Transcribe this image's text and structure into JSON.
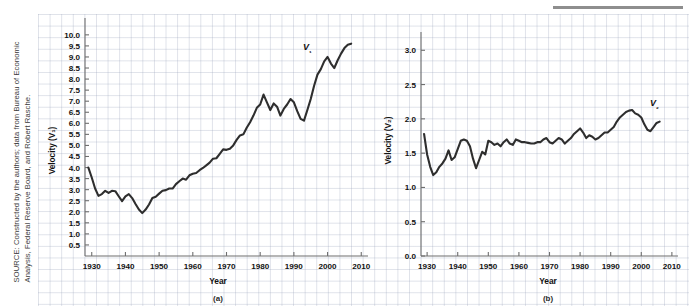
{
  "figure": {
    "source_note": "SOURCE: Constructed by the authors; data from Bureau of Economic Analysis, Federal Reserve Board, and Robert Rasche.",
    "panel_a_caption": "(a)",
    "panel_b_caption": "(b)"
  },
  "chart_data": [
    {
      "type": "line",
      "id": "panel-a",
      "title": "",
      "xlabel": "Year",
      "ylabel": "Velocity (V₁)",
      "series_label": "V₁",
      "xlim": [
        1928,
        2012
      ],
      "ylim": [
        0.0,
        10.4
      ],
      "xticks": [
        1930,
        1940,
        1950,
        1960,
        1970,
        1980,
        1990,
        2000,
        2010
      ],
      "xticklabels": [
        "1930",
        "1940",
        "1950",
        "1960",
        "1970",
        "1980",
        "1990",
        "2000",
        "2010"
      ],
      "yticks": [
        0.5,
        1.0,
        1.5,
        2.0,
        2.5,
        3.0,
        3.5,
        4.0,
        4.5,
        5.0,
        5.5,
        6.0,
        6.5,
        7.0,
        7.5,
        8.0,
        8.5,
        9.0,
        9.5,
        10.0
      ],
      "yticklabels": [
        "0.5",
        "1.0",
        "1.5",
        "2.0",
        "2.5",
        "3.0",
        "3.5",
        "4.0",
        "4.5",
        "5.0",
        "5.5",
        "6.0",
        "6.5",
        "7.0",
        "7.5",
        "8.0",
        "8.5",
        "9.0",
        "9.5",
        "10.0"
      ],
      "grid": true,
      "legend": "inline-label",
      "x": [
        1929,
        1930,
        1931,
        1932,
        1933,
        1934,
        1935,
        1936,
        1937,
        1938,
        1939,
        1940,
        1941,
        1942,
        1943,
        1944,
        1945,
        1946,
        1947,
        1948,
        1949,
        1950,
        1951,
        1952,
        1953,
        1954,
        1955,
        1956,
        1957,
        1958,
        1959,
        1960,
        1961,
        1962,
        1963,
        1964,
        1965,
        1966,
        1967,
        1968,
        1969,
        1970,
        1971,
        1972,
        1973,
        1974,
        1975,
        1976,
        1977,
        1978,
        1979,
        1980,
        1981,
        1982,
        1983,
        1984,
        1985,
        1986,
        1987,
        1988,
        1989,
        1990,
        1991,
        1992,
        1993,
        1994,
        1995,
        1996,
        1997,
        1998,
        1999,
        2000,
        2001,
        2002,
        2003,
        2004,
        2005,
        2006,
        2007
      ],
      "y": [
        4.0,
        3.55,
        3.05,
        2.72,
        2.8,
        2.95,
        2.85,
        2.95,
        2.93,
        2.7,
        2.48,
        2.7,
        2.8,
        2.62,
        2.35,
        2.1,
        1.94,
        2.1,
        2.33,
        2.62,
        2.68,
        2.82,
        2.95,
        2.98,
        3.05,
        3.05,
        3.25,
        3.38,
        3.5,
        3.45,
        3.65,
        3.72,
        3.75,
        3.88,
        3.98,
        4.1,
        4.22,
        4.4,
        4.42,
        4.62,
        4.82,
        4.8,
        4.85,
        5.0,
        5.25,
        5.45,
        5.5,
        5.8,
        6.05,
        6.35,
        6.7,
        6.85,
        7.3,
        6.95,
        6.6,
        6.9,
        6.75,
        6.35,
        6.65,
        6.85,
        7.1,
        6.95,
        6.55,
        6.2,
        6.12,
        6.6,
        7.1,
        7.7,
        8.2,
        8.45,
        8.8,
        9.0,
        8.7,
        8.5,
        8.85,
        9.15,
        9.4,
        9.55,
        9.6
      ]
    },
    {
      "type": "line",
      "id": "panel-b",
      "title": "",
      "xlabel": "Year",
      "ylabel": "Velocity (V₂)",
      "series_label": "V₂",
      "xlim": [
        1928,
        2012
      ],
      "ylim": [
        0.0,
        3.15
      ],
      "xticks": [
        1930,
        1940,
        1950,
        1960,
        1970,
        1980,
        1990,
        2000,
        2010
      ],
      "xticklabels": [
        "1930",
        "1940",
        "1950",
        "1960",
        "1970",
        "1980",
        "1990",
        "2000",
        "2010"
      ],
      "yticks": [
        0.0,
        0.5,
        1.0,
        1.5,
        2.0,
        2.5,
        3.0
      ],
      "yticklabels": [
        "0.0",
        "0.5",
        "1.0",
        "1.5",
        "2.0",
        "2.5",
        "3.0"
      ],
      "grid": true,
      "legend": "inline-label",
      "x": [
        1929,
        1930,
        1931,
        1932,
        1933,
        1934,
        1935,
        1936,
        1937,
        1938,
        1939,
        1940,
        1941,
        1942,
        1943,
        1944,
        1945,
        1946,
        1947,
        1948,
        1949,
        1950,
        1951,
        1952,
        1953,
        1954,
        1955,
        1956,
        1957,
        1958,
        1959,
        1960,
        1961,
        1962,
        1963,
        1964,
        1965,
        1966,
        1967,
        1968,
        1969,
        1970,
        1971,
        1972,
        1973,
        1974,
        1975,
        1976,
        1977,
        1978,
        1979,
        1980,
        1981,
        1982,
        1983,
        1984,
        1985,
        1986,
        1987,
        1988,
        1989,
        1990,
        1991,
        1992,
        1993,
        1994,
        1995,
        1996,
        1997,
        1998,
        1999,
        2000,
        2001,
        2002,
        2003,
        2004,
        2005,
        2006
      ],
      "y": [
        1.78,
        1.48,
        1.3,
        1.18,
        1.22,
        1.3,
        1.35,
        1.42,
        1.54,
        1.4,
        1.44,
        1.56,
        1.68,
        1.7,
        1.68,
        1.6,
        1.42,
        1.28,
        1.4,
        1.52,
        1.48,
        1.68,
        1.66,
        1.62,
        1.64,
        1.6,
        1.66,
        1.7,
        1.64,
        1.62,
        1.7,
        1.68,
        1.66,
        1.66,
        1.65,
        1.64,
        1.64,
        1.66,
        1.66,
        1.7,
        1.72,
        1.66,
        1.64,
        1.68,
        1.72,
        1.7,
        1.64,
        1.68,
        1.72,
        1.78,
        1.82,
        1.86,
        1.8,
        1.72,
        1.76,
        1.74,
        1.7,
        1.72,
        1.76,
        1.8,
        1.8,
        1.84,
        1.88,
        1.96,
        2.02,
        2.06,
        2.1,
        2.12,
        2.13,
        2.08,
        2.06,
        2.02,
        1.92,
        1.84,
        1.82,
        1.88,
        1.94,
        1.96
      ]
    }
  ]
}
